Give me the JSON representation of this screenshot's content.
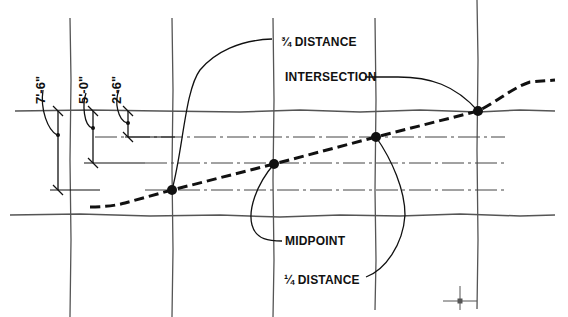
{
  "diagram": {
    "labels": {
      "three_quarter": "¾ DISTANCE",
      "intersection": "INTERSECTION",
      "midpoint": "MIDPOINT",
      "one_quarter": "¼ DISTANCE"
    },
    "dimensions": {
      "d1": "7'-6\"",
      "d2": "5'-0\"",
      "d3": "2'-6\""
    },
    "colors": {
      "ink": "#111111",
      "grid": "#555555",
      "background": "#ffffff"
    }
  }
}
